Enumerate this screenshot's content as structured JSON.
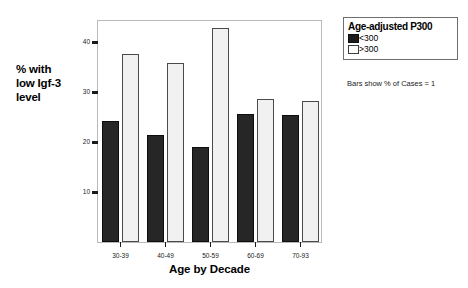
{
  "chart_data": {
    "type": "bar",
    "title": "",
    "xlabel": "Age by Decade",
    "ylabel": "% with low Igf-3 level",
    "categories": [
      "30-39",
      "40-49",
      "50-59",
      "60-69",
      "70-93"
    ],
    "series": [
      {
        "name": "<300",
        "color": "#262626",
        "values": [
          24.2,
          21.4,
          19.0,
          25.6,
          25.4
        ]
      },
      {
        "name": ">300",
        "color": "#f1f1f1",
        "values": [
          37.6,
          35.8,
          42.8,
          28.6,
          28.2
        ]
      }
    ],
    "ylim": [
      0,
      44.6
    ],
    "yticks": [
      10,
      20,
      30,
      40
    ],
    "ytick_labels": [
      "10",
      "20",
      "30",
      "40"
    ],
    "grid": false,
    "legend_position": "right-top",
    "annotations": [
      "Bars show % of Cases = 1"
    ]
  },
  "y_axis": {
    "title_lines": [
      "% with",
      "low Igf-3",
      "level"
    ],
    "tick_labels": [
      "10",
      "20",
      "30",
      "40"
    ]
  },
  "x_axis": {
    "title": "Age by Decade",
    "tick_labels": [
      "30-39",
      "40-49",
      "50-59",
      "60-69",
      "70-93"
    ]
  },
  "legend": {
    "title": "Age-adjusted P300",
    "items": [
      {
        "label": "<300",
        "swatch": "dark"
      },
      {
        "label": ">300",
        "swatch": "light"
      }
    ]
  },
  "footnote": "Bars show % of Cases = 1",
  "colors": {
    "bar_dark": "#262626",
    "bar_light": "#f1f1f1",
    "bar_light_outline": "#4a4a4a",
    "frame": "#b9b9b9",
    "text": "#000000"
  }
}
